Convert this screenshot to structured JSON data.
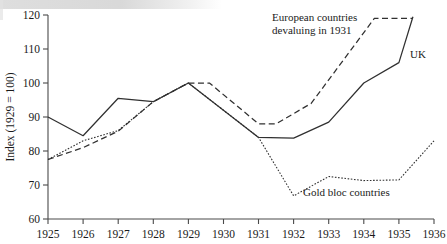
{
  "chart_data": {
    "type": "line",
    "title": "",
    "xlabel": "",
    "ylabel": "Index (1929 = 100)",
    "xlim": [
      1925,
      1936
    ],
    "ylim": [
      60,
      120
    ],
    "yticks": [
      60,
      70,
      80,
      90,
      100,
      110,
      120
    ],
    "xticks": [
      1925,
      1926,
      1927,
      1928,
      1929,
      1930,
      1931,
      1932,
      1933,
      1934,
      1935,
      1936
    ],
    "grid": false,
    "legend_position": "inline-annotations",
    "series": [
      {
        "name": "European countries devaluing in 1931",
        "style": "dashed",
        "x": [
          1925,
          1926,
          1927,
          1928,
          1929,
          1929.6,
          1931,
          1931.5,
          1932.5,
          1934.3,
          1935.4
        ],
        "values": [
          77.5,
          81.0,
          85.8,
          94.5,
          100.0,
          100.0,
          88.0,
          88.0,
          94.0,
          119.0,
          119.0
        ]
      },
      {
        "name": "UK",
        "style": "solid",
        "x": [
          1925,
          1926,
          1927,
          1928,
          1929,
          1930,
          1931,
          1932,
          1933,
          1934,
          1935,
          1935.4
        ],
        "values": [
          90.0,
          84.5,
          95.5,
          94.5,
          100.0,
          92.0,
          84.0,
          83.8,
          88.5,
          100.0,
          106.0,
          119.5
        ]
      },
      {
        "name": "Gold bloc countries",
        "style": "dotted",
        "x": [
          1925,
          1926,
          1927,
          1928,
          1929,
          1930,
          1931,
          1932,
          1933,
          1934,
          1935,
          1936
        ],
        "values": [
          77.5,
          83.0,
          86.0,
          94.5,
          100.0,
          92.0,
          84.0,
          66.8,
          72.5,
          71.3,
          71.5,
          83.0
        ]
      }
    ],
    "annotations": [
      {
        "id": "european",
        "line1": "European countries",
        "line2": "devaluing in 1931"
      },
      {
        "id": "uk",
        "text": "UK"
      },
      {
        "id": "goldbloc",
        "text": "Gold bloc countries"
      }
    ]
  },
  "axis": {
    "y_title": "Index (1929 = 100)",
    "y_tick_labels": [
      "120",
      "110",
      "100",
      "90",
      "80",
      "70",
      "60"
    ],
    "x_tick_labels": [
      "1925",
      "1926",
      "1927",
      "1928",
      "1929",
      "1930",
      "1931",
      "1932",
      "1933",
      "1934",
      "1935",
      "1936"
    ]
  },
  "annotations": {
    "european_line1": "European countries",
    "european_line2": "devaluing in 1931",
    "uk": "UK",
    "goldbloc": "Gold bloc countries"
  },
  "colors": {
    "ink": "#303030",
    "axis": "#4a4a4a",
    "background": "#ffffff"
  }
}
